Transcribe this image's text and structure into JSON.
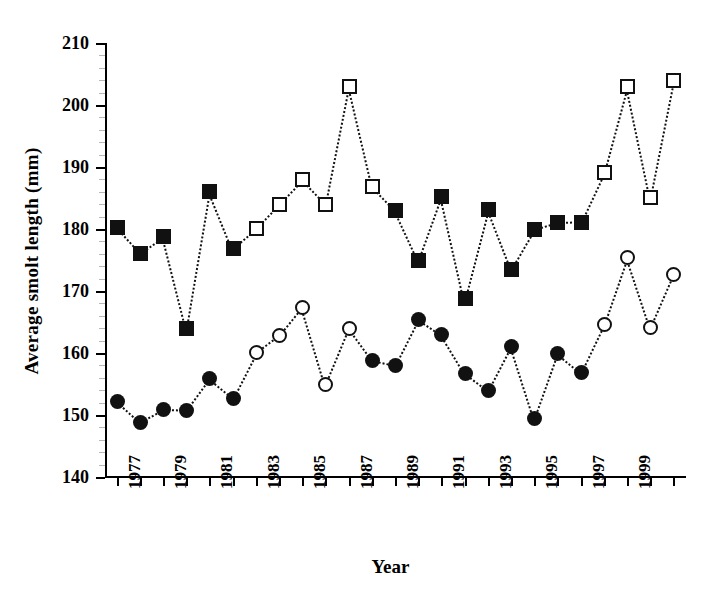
{
  "chart_data": {
    "type": "scatter",
    "title": "",
    "xlabel": "Year",
    "ylabel": "Average smolt length (mm)",
    "xlim": [
      1976.5,
      2001.5
    ],
    "ylim": [
      140,
      210
    ],
    "yticks": [
      140,
      150,
      160,
      170,
      180,
      190,
      200,
      210
    ],
    "yticklabels": [
      "140",
      "150",
      "160",
      "170",
      "180",
      "190",
      "200",
      "210"
    ],
    "xticks": [
      1977,
      1978,
      1979,
      1980,
      1981,
      1982,
      1983,
      1984,
      1985,
      1986,
      1987,
      1988,
      1989,
      1990,
      1991,
      1992,
      1993,
      1994,
      1995,
      1996,
      1997,
      1998,
      1999,
      2000,
      2001
    ],
    "xticklabels": [
      "1977",
      "",
      "1979",
      "",
      "1981",
      "",
      "1983",
      "",
      "1985",
      "",
      "1987",
      "",
      "1989",
      "",
      "1991",
      "",
      "1993",
      "",
      "1995",
      "",
      "1997",
      "",
      "1999",
      "",
      ""
    ],
    "grid": false,
    "legend": "none",
    "linestyle": "dotted",
    "x": [
      1977,
      1978,
      1979,
      1980,
      1981,
      1982,
      1983,
      1984,
      1985,
      1986,
      1987,
      1988,
      1989,
      1990,
      1991,
      1992,
      1993,
      1994,
      1995,
      1996,
      1997,
      1998,
      1999,
      2000,
      2001
    ],
    "series": [
      {
        "name": "Upper series (squares)",
        "marker": "square",
        "values": [
          180.3,
          176.2,
          178.8,
          164.0,
          186.2,
          177.0,
          180.2,
          184.1,
          188.0,
          184.1,
          203.0,
          187.0,
          183.1,
          175.0,
          185.4,
          168.8,
          183.2,
          173.6,
          180.0,
          181.1,
          181.2,
          189.2,
          203.1,
          185.2,
          204.0
        ],
        "fills": [
          "filled",
          "filled",
          "filled",
          "filled",
          "filled",
          "filled",
          "open",
          "open",
          "open",
          "open",
          "open",
          "open",
          "filled",
          "filled",
          "filled",
          "filled",
          "filled",
          "filled",
          "filled",
          "filled",
          "filled",
          "open",
          "open",
          "open",
          "open"
        ]
      },
      {
        "name": "Lower series (circles)",
        "marker": "circle",
        "values": [
          152.2,
          148.8,
          150.9,
          150.8,
          155.9,
          152.8,
          160.1,
          162.9,
          167.5,
          155.0,
          164.0,
          158.9,
          158.1,
          165.5,
          163.0,
          156.8,
          154.0,
          161.2,
          149.5,
          160.0,
          156.9,
          164.7,
          175.5,
          164.2,
          172.8
        ],
        "fills": [
          "filled",
          "filled",
          "filled",
          "filled",
          "filled",
          "filled",
          "open",
          "open",
          "open",
          "open",
          "open",
          "filled",
          "filled",
          "filled",
          "filled",
          "filled",
          "filled",
          "filled",
          "filled",
          "filled",
          "filled",
          "open",
          "open",
          "open",
          "open"
        ]
      }
    ]
  }
}
